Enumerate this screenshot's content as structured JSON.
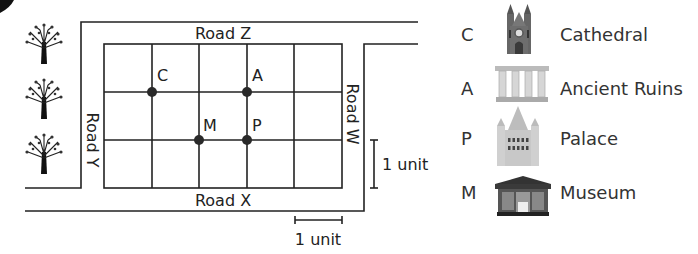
{
  "map": {
    "roads": {
      "top": "Road Z",
      "bottom": "Road X",
      "left": "Road Y",
      "right": "Road W"
    },
    "grid": {
      "columns": 5,
      "rows": 3,
      "unit_px": 48
    },
    "points": [
      {
        "letter": "C",
        "col": 1,
        "row": 1
      },
      {
        "letter": "A",
        "col": 3,
        "row": 1
      },
      {
        "letter": "M",
        "col": 2,
        "row": 2
      },
      {
        "letter": "P",
        "col": 3,
        "row": 2
      }
    ],
    "scale": {
      "vertical_label": "1 unit",
      "horizontal_label": "1 unit"
    },
    "trees": 3
  },
  "legend": [
    {
      "letter": "C",
      "name": "Cathedral",
      "icon": "cathedral-icon"
    },
    {
      "letter": "A",
      "name": "Ancient Ruins",
      "icon": "ancient-ruins-icon"
    },
    {
      "letter": "P",
      "name": "Palace",
      "icon": "palace-icon"
    },
    {
      "letter": "M",
      "name": "Museum",
      "icon": "museum-icon"
    }
  ],
  "colors": {
    "line": "#222222",
    "point": "#2a2a2a",
    "icon_dark": "#555555",
    "icon_light": "#cfcfcf"
  }
}
